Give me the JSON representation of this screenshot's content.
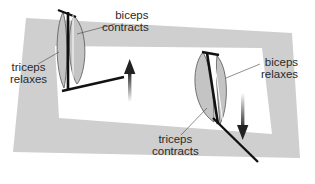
{
  "diagram": {
    "colors": {
      "frame": "#cfcfcf",
      "muscle_fill": "#c4c4c4",
      "muscle_stroke": "#555555",
      "bone": "#1a1a1a",
      "text": "#2a2a2a",
      "background": "#ffffff"
    },
    "left_arm": {
      "state": "arm bending (flexion)",
      "labels": {
        "biceps": [
          "biceps",
          "contracts"
        ],
        "triceps": [
          "triceps",
          "relaxes"
        ]
      },
      "arrow": "up"
    },
    "right_arm": {
      "state": "arm straightening (extension)",
      "labels": {
        "biceps": [
          "biceps",
          "relaxes"
        ],
        "triceps": [
          "triceps",
          "contracts"
        ]
      },
      "arrow": "down"
    }
  }
}
